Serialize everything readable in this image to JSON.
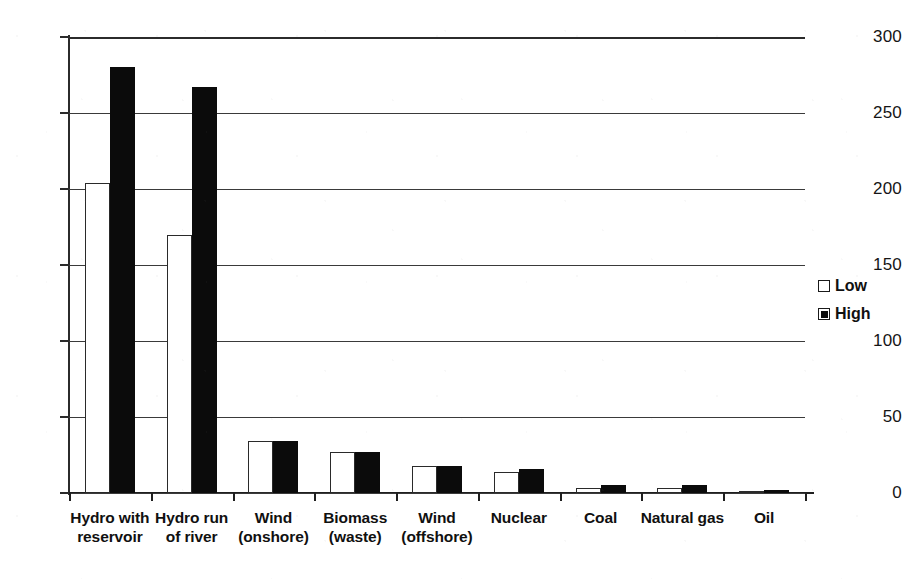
{
  "chart_data": {
    "type": "bar",
    "title": "",
    "subtitle": "",
    "xlabel": "",
    "ylabel": "",
    "ylim": [
      0,
      300
    ],
    "yticks": [
      0,
      50,
      100,
      150,
      200,
      250,
      300
    ],
    "ytick_labels": [
      "0",
      "50",
      "100",
      "150",
      "200",
      "250",
      "300"
    ],
    "grid": true,
    "grid_axis": "y",
    "legend_position": "right",
    "categories": [
      "Hydro with reservoir",
      "Hydro run of river",
      "Wind (onshore)",
      "Biomass (waste)",
      "Wind (offshore)",
      "Nuclear",
      "Coal",
      "Natural gas",
      "Oil"
    ],
    "category_lines": [
      [
        "Hydro with",
        "reservoir"
      ],
      [
        "Hydro run",
        "of river"
      ],
      [
        "Wind",
        "(onshore)"
      ],
      [
        "Biomass",
        "(waste)"
      ],
      [
        "Wind",
        "(offshore)"
      ],
      [
        "Nuclear",
        ""
      ],
      [
        "Coal",
        ""
      ],
      [
        "Natural gas",
        ""
      ],
      [
        "Oil",
        ""
      ]
    ],
    "series": [
      {
        "name": "Low",
        "color": "#ffffff",
        "edge_color": "#2a2a2a",
        "values": [
          204,
          170,
          34,
          27,
          18,
          14,
          3,
          3,
          1
        ]
      },
      {
        "name": "High",
        "color": "#0b0b0b",
        "edge_color": "#0b0b0b",
        "values": [
          280,
          267,
          34,
          27,
          18,
          16,
          5,
          5,
          2
        ]
      }
    ]
  },
  "legend": {
    "items": [
      {
        "label": "Low",
        "swatch": "open-square-icon"
      },
      {
        "label": "High",
        "swatch": "filled-square-icon"
      }
    ]
  },
  "colors": {
    "axis": "#2b2b2b",
    "gridline": "#3a3a3a",
    "text": "#101010",
    "background": "#ffffff"
  }
}
